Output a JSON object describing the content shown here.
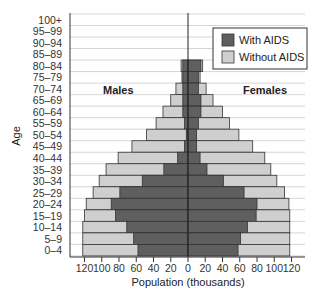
{
  "chart_data": {
    "type": "bar",
    "subtype": "population-pyramid",
    "title": "",
    "xlabel": "Population (thousands)",
    "ylabel": "Age",
    "xlim": [
      -120,
      120
    ],
    "x_ticks": [
      120,
      100,
      80,
      60,
      40,
      20,
      0,
      20,
      40,
      60,
      80,
      100,
      120
    ],
    "grid": true,
    "legend_position": "upper right",
    "annotations": [
      "Males",
      "Females"
    ],
    "categories": [
      "100+",
      "95–99",
      "90–94",
      "85–89",
      "80–84",
      "75–79",
      "70–74",
      "65–69",
      "60–64",
      "55–59",
      "50–54",
      "45–49",
      "40–44",
      "35–39",
      "30–34",
      "25–29",
      "20–24",
      "15–19",
      "10–14",
      "5–9",
      "0–4"
    ],
    "series": [
      {
        "name": "Males – With AIDS",
        "side": "left",
        "legend": "With AIDS",
        "color": "#5f5f5f",
        "values": [
          0,
          0,
          0,
          0,
          6,
          6,
          6,
          6,
          6,
          4,
          2,
          4,
          12,
          28,
          53,
          79,
          89,
          84,
          71,
          63,
          58
        ]
      },
      {
        "name": "Males – Without AIDS (total shown)",
        "side": "left",
        "legend": "Without AIDS",
        "color": "#cfcfcf",
        "values": [
          0,
          0,
          0,
          0,
          8,
          7,
          14,
          20,
          29,
          37,
          48,
          65,
          81,
          95,
          103,
          110,
          118,
          120,
          122,
          122,
          122
        ]
      },
      {
        "name": "Females – With AIDS",
        "side": "right",
        "legend": "With AIDS",
        "color": "#5f5f5f",
        "values": [
          0,
          0,
          0,
          0,
          15,
          12,
          12,
          15,
          15,
          12,
          10,
          10,
          14,
          22,
          41,
          65,
          80,
          79,
          69,
          61,
          58
        ]
      },
      {
        "name": "Females – Without AIDS (total shown)",
        "side": "right",
        "legend": "Without AIDS",
        "color": "#cfcfcf",
        "values": [
          0,
          0,
          0,
          0,
          17,
          14,
          21,
          29,
          40,
          48,
          59,
          75,
          89,
          96,
          103,
          112,
          117,
          118,
          118,
          118,
          118
        ]
      }
    ],
    "legend": [
      {
        "label": "With AIDS",
        "color": "#5f5f5f"
      },
      {
        "label": "Without AIDS",
        "color": "#cfcfcf"
      }
    ]
  },
  "labels": {
    "males": "Males",
    "females": "Females",
    "xlabel": "Population (thousands)",
    "ylabel": "Age",
    "legend_with": "With AIDS",
    "legend_without": "Without AIDS"
  }
}
